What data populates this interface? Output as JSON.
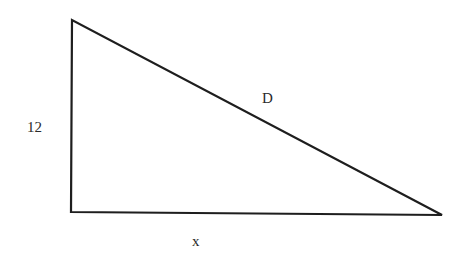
{
  "diagram": {
    "type": "right-triangle",
    "stroke_color": "#1e1e1e",
    "background_color": "#ffffff",
    "vertices": {
      "top": [
        72,
        20
      ],
      "bottom_left": [
        71,
        212
      ],
      "right": [
        442,
        215
      ]
    },
    "labels": {
      "height": "12",
      "hypotenuse": "D",
      "base": "x"
    }
  }
}
